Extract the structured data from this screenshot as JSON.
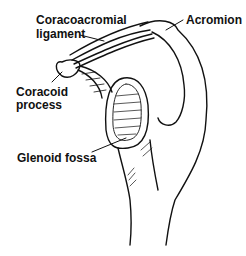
{
  "diagram": {
    "labels": {
      "coracoacromial_line1": "Coracoacromial",
      "coracoacromial_line2": "ligament",
      "acromion": "Acromion",
      "coracoid_line1": "Coracoid",
      "coracoid_line2": "process",
      "glenoid": "Glenoid fossa"
    },
    "colors": {
      "ink": "#111111",
      "background": "#ffffff"
    }
  }
}
